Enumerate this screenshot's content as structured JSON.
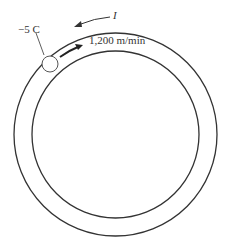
{
  "diagram": {
    "charge_label": "−5 C",
    "speed_label": "1,200 m/min",
    "current_label": "I",
    "colors": {
      "stroke": "#333333",
      "background": "#ffffff"
    }
  }
}
